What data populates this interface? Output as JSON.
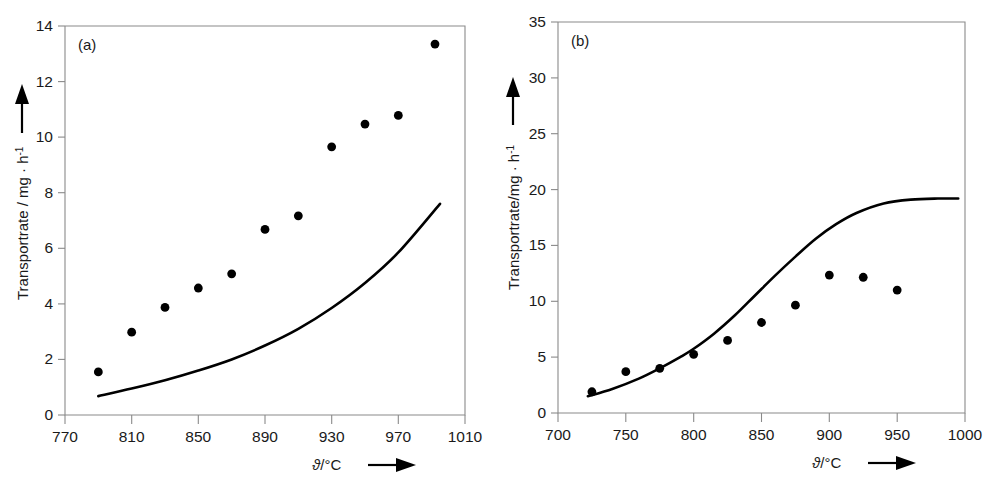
{
  "figure": {
    "background_color": "#ffffff",
    "axis_color": "#8a8a8a",
    "data_color": "#000000",
    "panel_count": 2
  },
  "panel_a": {
    "tag": "(a)",
    "x_axis_title_symbol": "ϑ",
    "x_axis_title_rest": "/°C",
    "y_axis_title_main": "Transportrate / mg · h",
    "y_axis_title_sup": "-1",
    "x_ticks": [
      "770",
      "810",
      "850",
      "890",
      "930",
      "970",
      "1010"
    ],
    "y_ticks": [
      "0",
      "2",
      "4",
      "6",
      "8",
      "10",
      "12",
      "14"
    ]
  },
  "panel_b": {
    "tag": "(b)",
    "x_axis_title_symbol": "ϑ",
    "x_axis_title_rest": "/°C",
    "y_axis_title_main": "Transportrate/mg · h",
    "y_axis_title_sup": "-1",
    "x_ticks": [
      "700",
      "750",
      "800",
      "850",
      "900",
      "950",
      "1000"
    ],
    "y_ticks": [
      "0",
      "5",
      "10",
      "15",
      "20",
      "25",
      "30",
      "35"
    ]
  },
  "chart_data": [
    {
      "type": "scatter",
      "panel": "(a)",
      "title": "",
      "xlabel": "ϑ/°C",
      "ylabel": "Transportrate / mg · h-1",
      "xlim": [
        770,
        1010
      ],
      "ylim": [
        0,
        14
      ],
      "xticks": [
        770,
        810,
        850,
        890,
        930,
        970,
        1010
      ],
      "yticks": [
        0,
        2,
        4,
        6,
        8,
        10,
        12,
        14
      ],
      "grid": false,
      "legend": "none",
      "series": [
        {
          "name": "measured transport rate",
          "marker": "filled-circle",
          "x": [
            790,
            810,
            830,
            850,
            870,
            890,
            910,
            930,
            950,
            970,
            992
          ],
          "values": [
            1.55,
            2.98,
            3.87,
            4.57,
            5.08,
            6.68,
            7.17,
            9.65,
            10.47,
            10.78,
            13.35
          ]
        },
        {
          "name": "calculated transport rate",
          "marker": "line",
          "x": [
            790,
            810,
            830,
            850,
            870,
            890,
            910,
            930,
            950,
            970,
            995
          ],
          "values": [
            0.68,
            0.95,
            1.25,
            1.6,
            2.0,
            2.5,
            3.1,
            3.85,
            4.75,
            5.85,
            7.6
          ]
        }
      ]
    },
    {
      "type": "scatter",
      "panel": "(b)",
      "title": "",
      "xlabel": "ϑ/°C",
      "ylabel": "Transportrate/mg · h-1",
      "xlim": [
        700,
        1000
      ],
      "ylim": [
        0,
        35
      ],
      "xticks": [
        700,
        750,
        800,
        850,
        900,
        950,
        1000
      ],
      "yticks": [
        0,
        5,
        10,
        15,
        20,
        25,
        30,
        35
      ],
      "grid": false,
      "legend": "none",
      "series": [
        {
          "name": "measured transport rate",
          "marker": "filled-circle",
          "x": [
            725,
            750,
            775,
            800,
            825,
            850,
            875,
            900,
            925,
            950
          ],
          "values": [
            1.9,
            3.7,
            4.0,
            5.25,
            6.5,
            8.1,
            9.65,
            12.35,
            12.15,
            11.0
          ]
        },
        {
          "name": "calculated transport rate",
          "marker": "line",
          "x": [
            722,
            740,
            760,
            775,
            790,
            800,
            815,
            830,
            845,
            860,
            875,
            890,
            905,
            920,
            940,
            960,
            980,
            995
          ],
          "values": [
            1.5,
            2.15,
            3.1,
            4.0,
            5.0,
            5.75,
            7.1,
            8.7,
            10.5,
            12.3,
            14.0,
            15.6,
            16.9,
            17.9,
            18.75,
            19.1,
            19.2,
            19.2
          ]
        }
      ]
    }
  ]
}
